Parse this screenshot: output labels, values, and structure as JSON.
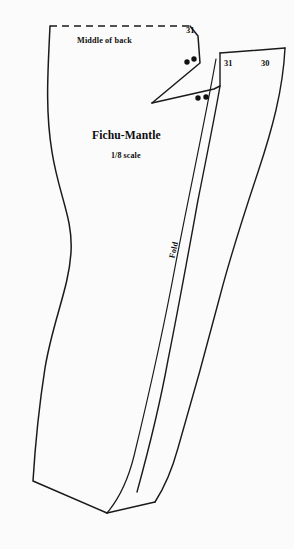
{
  "document": {
    "title": "Fichu-Mantle",
    "scale_note": "1/8 scale",
    "type": "sewing-pattern-diagram"
  },
  "labels": {
    "middle_of_back": "Middle of back",
    "fold": "Fold"
  },
  "piece_numbers": {
    "left_panel": "31",
    "right_panel_inner": "31",
    "right_panel_outer": "30"
  },
  "colors": {
    "background": "#fbfbfb",
    "ink": "#1a1a1a",
    "text": "#0d0d0d"
  },
  "markings": {
    "dot_pair_upper_count": 2,
    "dot_pair_lower_count": 2,
    "fold_line_present": true,
    "dashed_edge": "Middle of back"
  }
}
